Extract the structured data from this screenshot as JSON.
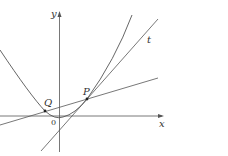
{
  "diagram": {
    "type": "function-graph",
    "labels": {
      "y_axis": "y",
      "x_axis": "x",
      "origin": "0",
      "point_p": "P",
      "point_q": "Q",
      "tangent": "t"
    },
    "colors": {
      "stroke": "#555555",
      "text": "#333333",
      "background": "#ffffff"
    },
    "elements": [
      {
        "name": "x-axis",
        "kind": "axis",
        "label": "x"
      },
      {
        "name": "y-axis",
        "kind": "axis",
        "label": "y"
      },
      {
        "name": "parabola",
        "kind": "curve"
      },
      {
        "name": "tangent-line",
        "kind": "line",
        "label": "t",
        "touches": "P"
      },
      {
        "name": "secant-line",
        "kind": "line",
        "through": [
          "Q",
          "P"
        ]
      },
      {
        "name": "point-p",
        "kind": "point",
        "label": "P"
      },
      {
        "name": "point-q",
        "kind": "point",
        "label": "Q"
      }
    ]
  }
}
